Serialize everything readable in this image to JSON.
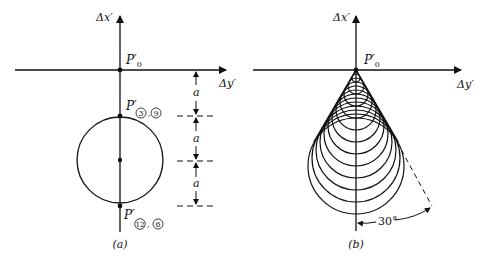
{
  "figure_a": {
    "caption": "(a)",
    "axis_x_label": "Δx′",
    "axis_y_label": "Δy′",
    "origin_label": "P′",
    "origin_sub": "0",
    "top_point_label": "P′",
    "top_point_marks": [
      "3",
      "9"
    ],
    "bottom_point_label": "P′",
    "bottom_point_marks": [
      "12",
      "6"
    ],
    "dimension_label": "a",
    "dimension_count": 3
  },
  "figure_b": {
    "caption": "(b)",
    "axis_x_label": "Δx′",
    "axis_y_label": "Δy′",
    "origin_label": "P′",
    "origin_sub": "0",
    "angle_label": "30°",
    "circle_count": 12
  },
  "colors": {
    "ink": "#111111",
    "background": "#ffffff"
  }
}
